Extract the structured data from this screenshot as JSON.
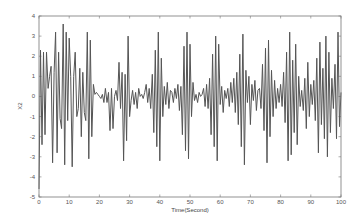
{
  "chart_data": {
    "type": "line",
    "title": "",
    "xlabel": "Time(Second)",
    "ylabel": "X2",
    "xlim": [
      0,
      100
    ],
    "ylim": [
      -5,
      4
    ],
    "xticks": [
      0,
      10,
      20,
      30,
      40,
      50,
      60,
      70,
      80,
      90,
      100
    ],
    "yticks": [
      4,
      3,
      2,
      1,
      0,
      -1,
      -2,
      -3,
      -4,
      -5
    ],
    "grid": false,
    "legend": null,
    "line_color": "#555555",
    "series": [
      {
        "name": "X2",
        "x": [
          0,
          0.5,
          1,
          1.5,
          2,
          2.5,
          3,
          3.5,
          4,
          4.5,
          5,
          5.5,
          6,
          6.5,
          7,
          7.5,
          8,
          8.5,
          9,
          9.5,
          10,
          10.5,
          11,
          11.5,
          12,
          12.5,
          13,
          13.5,
          14,
          14.5,
          15,
          15.5,
          16,
          16.5,
          17,
          17.5,
          18,
          18.5,
          19,
          19.5,
          20,
          20.5,
          21,
          21.5,
          22,
          22.5,
          23,
          23.5,
          24,
          24.5,
          25,
          25.5,
          26,
          26.5,
          27,
          27.5,
          28,
          28.5,
          29,
          29.5,
          30,
          30.5,
          31,
          31.5,
          32,
          32.5,
          33,
          33.5,
          34,
          34.5,
          35,
          35.5,
          36,
          36.5,
          37,
          37.5,
          38,
          38.5,
          39,
          39.5,
          40,
          40.5,
          41,
          41.5,
          42,
          42.5,
          43,
          43.5,
          44,
          44.5,
          45,
          45.5,
          46,
          46.5,
          47,
          47.5,
          48,
          48.5,
          49,
          49.5,
          50,
          50.5,
          51,
          51.5,
          52,
          52.5,
          53,
          53.5,
          54,
          54.5,
          55,
          55.5,
          56,
          56.5,
          57,
          57.5,
          58,
          58.5,
          59,
          59.5,
          60,
          60.5,
          61,
          61.5,
          62,
          62.5,
          63,
          63.5,
          64,
          64.5,
          65,
          65.5,
          66,
          66.5,
          67,
          67.5,
          68,
          68.5,
          69,
          69.5,
          70,
          70.5,
          71,
          71.5,
          72,
          72.5,
          73,
          73.5,
          74,
          74.5,
          75,
          75.5,
          76,
          76.5,
          77,
          77.5,
          78,
          78.5,
          79,
          79.5,
          80,
          80.5,
          81,
          81.5,
          82,
          82.5,
          83,
          83.5,
          84,
          84.5,
          85,
          85.5,
          86,
          86.5,
          87,
          87.5,
          88,
          88.5,
          89,
          89.5,
          90,
          90.5,
          91,
          91.5,
          92,
          92.5,
          93,
          93.5,
          94,
          94.5,
          95,
          95.5,
          96,
          96.5,
          97,
          97.5,
          98,
          98.5,
          99,
          99.5,
          100
        ],
        "y": [
          -4.6,
          2.3,
          -2.4,
          2.2,
          -1.9,
          2.2,
          0.4,
          1.0,
          1.5,
          -3.3,
          1.2,
          3.2,
          -2.8,
          2.2,
          -1.1,
          -1.6,
          3.6,
          -3.4,
          3.2,
          -1.2,
          2.9,
          1.0,
          -3.5,
          1.0,
          2.2,
          -1.0,
          -0.6,
          1.4,
          -2.0,
          1.2,
          -0.8,
          -1.2,
          3.2,
          -3.1,
          2.8,
          -2.0,
          0.6,
          0.1,
          0.2,
          0.1,
          0.0,
          -0.1,
          0.1,
          -0.3,
          0.4,
          -0.3,
          0.2,
          -1.7,
          0.4,
          -1.6,
          0.0,
          0.3,
          -0.2,
          1.7,
          -0.6,
          1.2,
          -3.2,
          1.1,
          -2.2,
          3.0,
          -1.0,
          -0.2,
          0.3,
          -0.4,
          0.2,
          -0.6,
          0.4,
          0.0,
          0.1,
          -0.1,
          0.2,
          0.6,
          -0.3,
          0.4,
          -0.6,
          1.1,
          -1.8,
          2.3,
          -2.5,
          3.2,
          -3.2,
          1.9,
          -1.0,
          0.5,
          -0.4,
          0.7,
          -0.6,
          0.3,
          0.2,
          -0.3,
          0.4,
          -0.1,
          0.6,
          -0.7,
          0.5,
          -1.9,
          2.5,
          -2.7,
          3.2,
          -3.1,
          2.6,
          -1.0,
          0.7,
          -0.2,
          0.1,
          -0.3,
          0.2,
          0.0,
          0.1,
          0.4,
          -0.5,
          0.6,
          -0.6,
          0.9,
          -1.9,
          2.1,
          -2.5,
          3.0,
          -3.2,
          2.6,
          -0.4,
          0.5,
          -0.8,
          0.3,
          -0.1,
          0.4,
          -0.5,
          0.7,
          -0.3,
          0.9,
          -0.8,
          1.2,
          -1.4,
          2.1,
          -2.5,
          3.1,
          -3.4,
          1.3,
          -0.3,
          1.0,
          -1.4,
          0.6,
          -0.2,
          0.8,
          -0.7,
          0.3,
          0.4,
          -0.6,
          1.6,
          -1.7,
          2.4,
          -3.3,
          2.8,
          -2.0,
          1.3,
          -1.0,
          0.8,
          -0.6,
          0.4,
          -0.3,
          0.6,
          -0.5,
          1.2,
          -1.3,
          2.2,
          -3.2,
          3.2,
          -2.9,
          1.8,
          -1.8,
          2.6,
          -2.4,
          1.0,
          -0.5,
          0.3,
          -0.7,
          0.9,
          -1.6,
          1.7,
          -1.0,
          0.6,
          -0.4,
          0.8,
          -1.2,
          1.9,
          -2.8,
          2.7,
          -1.4,
          1.4,
          -2.1,
          3.0,
          -3.0,
          2.2,
          -1.8,
          0.9,
          -0.6,
          1.6,
          -2.1,
          3.2,
          -1.5,
          0.2
        ]
      }
    ]
  }
}
